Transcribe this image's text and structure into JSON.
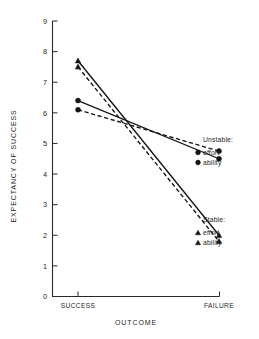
{
  "chart_data": {
    "type": "line",
    "title": "",
    "xlabel": "OUTCOME",
    "ylabel": "EXPECTANCY OF SUCCESS",
    "categories": [
      "SUCCESS",
      "FAILURE"
    ],
    "ylim": [
      0,
      9
    ],
    "yticks": [
      0,
      1,
      2,
      3,
      4,
      5,
      6,
      7,
      8,
      9
    ],
    "ytick_labels": [
      "0",
      "1",
      "2",
      "3",
      "4",
      "5",
      "6",
      "7",
      "8",
      "9"
    ],
    "grid": false,
    "legend_position": "right-inline",
    "series": [
      {
        "name": "Unstable effort",
        "group": "Unstable",
        "label": "effort",
        "marker": "circle",
        "line_style": "solid",
        "values": [
          6.4,
          4.5
        ]
      },
      {
        "name": "Unstable ability",
        "group": "Unstable",
        "label": "ability",
        "marker": "circle",
        "line_style": "dashed",
        "values": [
          6.1,
          4.75
        ]
      },
      {
        "name": "Stable effort",
        "group": "Stable",
        "label": "effort",
        "marker": "triangle",
        "line_style": "solid",
        "values": [
          7.7,
          2.0
        ]
      },
      {
        "name": "Stable ability",
        "group": "Stable",
        "label": "ability",
        "marker": "triangle",
        "line_style": "dashed",
        "values": [
          7.5,
          1.8
        ]
      }
    ],
    "legend_groups": [
      {
        "heading": "Unstable:",
        "entries": [
          {
            "label": "effort",
            "marker": "circle"
          },
          {
            "label": "ability",
            "marker": "circle"
          }
        ]
      },
      {
        "heading": "Stable:",
        "entries": [
          {
            "label": "effort",
            "marker": "triangle"
          },
          {
            "label": "ability",
            "marker": "triangle"
          }
        ]
      }
    ],
    "colors": {
      "line": "#141414",
      "axis": "#2a2a2a",
      "text": "#1f1f1f",
      "background": "#ffffff"
    }
  }
}
